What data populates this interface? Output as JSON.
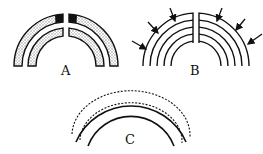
{
  "panels": [
    {
      "id": "A",
      "label": "A",
      "description": "Two concentric split arcs with stippled fill and black wedge at top of outer arc"
    },
    {
      "id": "B",
      "label": "B",
      "description": "Five concentric split arcs with six arrows pointing inward"
    },
    {
      "id": "C",
      "label": "C",
      "description": "Two solid arcs overlaid with two dashed arcs"
    }
  ],
  "colors": {
    "stroke": "#111111",
    "stipple": "#9a9a9a",
    "background": "#ffffff"
  }
}
